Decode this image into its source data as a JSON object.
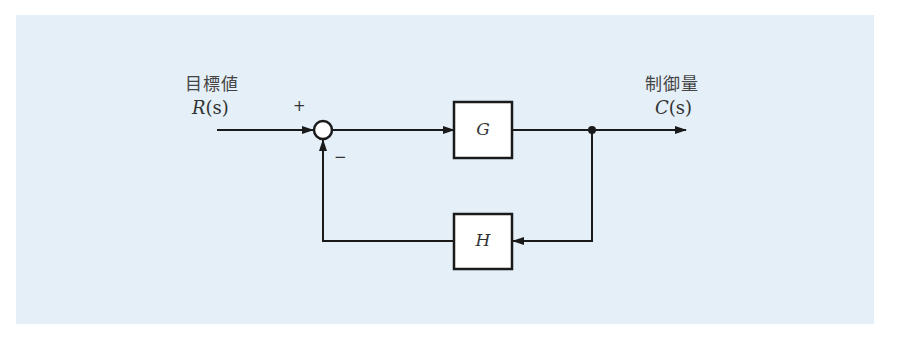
{
  "diagram": {
    "type": "feedback-control-block-diagram",
    "input": {
      "title": "目標値",
      "signal": "R",
      "arg": "(s)"
    },
    "output": {
      "title": "制御量",
      "signal": "C",
      "arg": "(s)"
    },
    "summing_junction": {
      "plus_sign": "+",
      "minus_sign": "−"
    },
    "forward_block": {
      "label": "G"
    },
    "feedback_block": {
      "label": "H"
    },
    "colors": {
      "background": "#e4eff8",
      "line": "#1a1a1a",
      "block_fill": "#ffffff"
    }
  }
}
